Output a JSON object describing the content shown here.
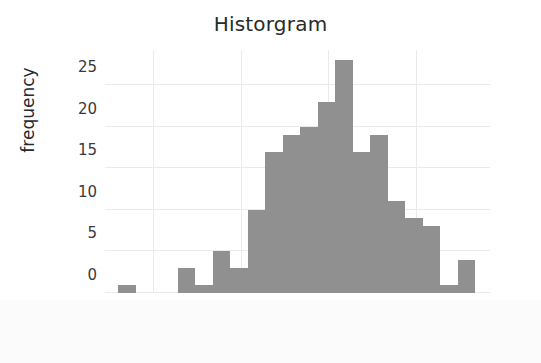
{
  "chart_data": {
    "type": "bar",
    "title": "Historgram",
    "xlabel": "bin range",
    "ylabel": "frequency",
    "grid": true,
    "legend": null,
    "xlim": [
      54.5,
      98.5
    ],
    "ylim": [
      0,
      29.2
    ],
    "xticks": [
      60,
      70,
      80,
      90
    ],
    "yticks": [
      0,
      5,
      10,
      15,
      20,
      25
    ],
    "bin_width": 2,
    "bin_edges": [
      56,
      58,
      62.8,
      64.8,
      66.8,
      68.8,
      70.8,
      72.8,
      74.8,
      76.8,
      78.8,
      80.8,
      82.8,
      84.8,
      86.8,
      88.8,
      90.8,
      92.8,
      94.8,
      96.8
    ],
    "categories": [
      "56-58",
      "62.8-64.8",
      "64.8-66.8",
      "66.8-68.8",
      "68.8-70.8",
      "70.8-72.8",
      "72.8-74.8",
      "74.8-76.8",
      "76.8-78.8",
      "78.8-80.8",
      "80.8-82.8",
      "82.8-84.8",
      "84.8-86.8",
      "86.8-88.8",
      "88.8-90.8",
      "90.8-92.8",
      "92.8-94.8",
      "94.8-96.8"
    ],
    "bars": [
      {
        "x0": 56.0,
        "x1": 58.0,
        "value": 1
      },
      {
        "x0": 62.8,
        "x1": 64.8,
        "value": 3
      },
      {
        "x0": 64.8,
        "x1": 66.8,
        "value": 1
      },
      {
        "x0": 66.8,
        "x1": 68.8,
        "value": 5
      },
      {
        "x0": 68.8,
        "x1": 70.8,
        "value": 3
      },
      {
        "x0": 70.8,
        "x1": 72.8,
        "value": 10
      },
      {
        "x0": 72.8,
        "x1": 74.8,
        "value": 17
      },
      {
        "x0": 74.8,
        "x1": 76.8,
        "value": 19
      },
      {
        "x0": 76.8,
        "x1": 78.8,
        "value": 20
      },
      {
        "x0": 78.8,
        "x1": 80.8,
        "value": 23
      },
      {
        "x0": 80.8,
        "x1": 82.8,
        "value": 28
      },
      {
        "x0": 82.8,
        "x1": 84.8,
        "value": 17
      },
      {
        "x0": 84.8,
        "x1": 86.8,
        "value": 19
      },
      {
        "x0": 86.8,
        "x1": 88.8,
        "value": 11
      },
      {
        "x0": 88.8,
        "x1": 90.8,
        "value": 9
      },
      {
        "x0": 90.8,
        "x1": 92.8,
        "value": 8
      },
      {
        "x0": 92.8,
        "x1": 94.8,
        "value": 1
      },
      {
        "x0": 94.8,
        "x1": 96.8,
        "value": 4
      }
    ],
    "values": [
      1,
      3,
      1,
      5,
      3,
      10,
      17,
      19,
      20,
      23,
      28,
      17,
      19,
      11,
      9,
      8,
      1,
      4
    ],
    "colors": {
      "bar_fill": "#909090",
      "grid": "#eaeaea",
      "text": "#2a2a2a",
      "tick_text": "#3a3a3a",
      "background": "#ffffff"
    }
  }
}
